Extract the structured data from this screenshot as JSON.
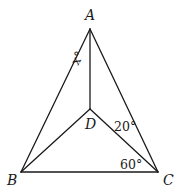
{
  "diagram": {
    "points": {
      "A": {
        "label": "A"
      },
      "B": {
        "label": "B"
      },
      "C": {
        "label": "C"
      },
      "D": {
        "label": "D"
      }
    },
    "segments": [
      "AB",
      "AC",
      "BC",
      "AD",
      "BD",
      "CD"
    ],
    "angles": {
      "BAD": {
        "label": "x°",
        "value": "x"
      },
      "DCA": {
        "label": "20°",
        "value": 20
      },
      "BCD": {
        "label": "60°",
        "value": 60
      }
    }
  }
}
